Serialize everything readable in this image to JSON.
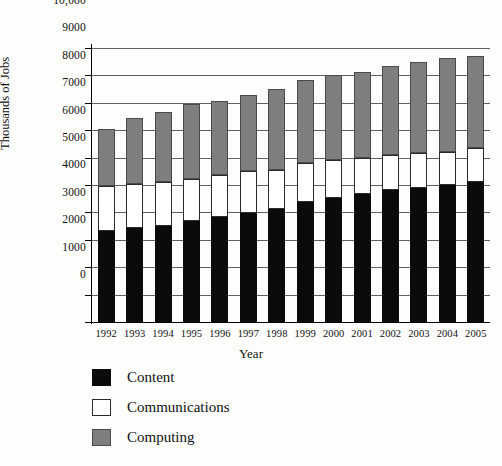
{
  "chart_data": {
    "type": "bar",
    "stacked": true,
    "title": "",
    "xlabel": "Year",
    "ylabel": "Thousands of Jobs",
    "ylim": [
      0,
      10000
    ],
    "ytick_step": 1000,
    "grid": true,
    "legend_position": "bottom-left",
    "categories": [
      "1992",
      "1993",
      "1994",
      "1995",
      "1996",
      "1997",
      "1998",
      "1999",
      "2000",
      "2001",
      "2002",
      "2003",
      "2004",
      "2005"
    ],
    "ytick_labels": [
      "10,000",
      "9000",
      "8000",
      "7000",
      "6000",
      "5000",
      "4000",
      "3000",
      "2000",
      "1000",
      "0"
    ],
    "ytick_values": [
      10000,
      9000,
      8000,
      7000,
      6000,
      5000,
      4000,
      3000,
      2000,
      1000,
      0
    ],
    "series": [
      {
        "name": "Content",
        "color": "#0b0b0b",
        "values": [
          3330,
          3420,
          3510,
          3700,
          3850,
          3980,
          4120,
          4380,
          4520,
          4680,
          4820,
          4900,
          5000,
          5100
        ]
      },
      {
        "name": "Communications",
        "color": "#ffffff",
        "values": [
          1650,
          1630,
          1610,
          1520,
          1530,
          1520,
          1440,
          1420,
          1380,
          1320,
          1280,
          1250,
          1200,
          1250
        ]
      },
      {
        "name": "Computing",
        "color": "#7e7e7e",
        "values": [
          2070,
          2400,
          2530,
          2730,
          2700,
          2780,
          2940,
          3050,
          3100,
          3120,
          3250,
          3350,
          3420,
          3350
        ]
      }
    ],
    "totals": [
      7050,
      7450,
      7650,
      7950,
      8080,
      8280,
      8500,
      8850,
      9000,
      9120,
      9350,
      9500,
      9620,
      9700
    ]
  },
  "axes": {
    "y_title": "Thousands of Jobs",
    "x_title": "Year"
  },
  "legend": {
    "items": [
      {
        "label": "Content",
        "swatch": "content-swatch"
      },
      {
        "label": "Communications",
        "swatch": "communications-swatch"
      },
      {
        "label": "Computing",
        "swatch": "computing-swatch"
      }
    ]
  }
}
